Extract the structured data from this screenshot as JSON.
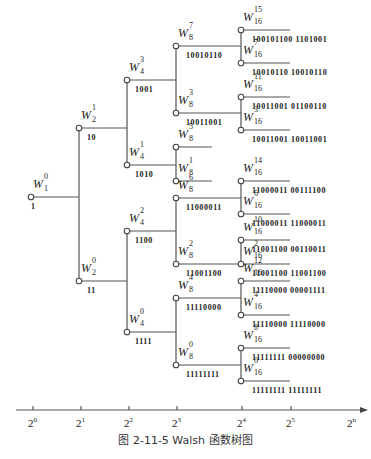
{
  "figure": {
    "caption": "图 2-11-5   Walsh 函数树图",
    "title": "Walsh 函数树图"
  },
  "nodes": [
    {
      "id": "W1_0",
      "base": "W",
      "sup": "0",
      "sub": "1",
      "code": "1",
      "x": 31,
      "y": 197
    },
    {
      "id": "W2_1",
      "base": "W",
      "sup": "1",
      "sub": "2",
      "code": "10",
      "x": 79,
      "y": 128
    },
    {
      "id": "W2_0",
      "base": "W",
      "sup": "0",
      "sub": "2",
      "code": "11",
      "x": 79,
      "y": 281
    },
    {
      "id": "W4_3",
      "base": "W",
      "sup": "3",
      "sub": "4",
      "code": "1001",
      "x": 127,
      "y": 80
    },
    {
      "id": "W4_1",
      "base": "W",
      "sup": "1",
      "sub": "4",
      "code": "1010",
      "x": 127,
      "y": 165
    },
    {
      "id": "W4_2",
      "base": "W",
      "sup": "2",
      "sub": "4",
      "code": "1100",
      "x": 127,
      "y": 231
    },
    {
      "id": "W4_0",
      "base": "W",
      "sup": "0",
      "sub": "4",
      "code": "1111",
      "x": 127,
      "y": 332
    },
    {
      "id": "W8_7",
      "base": "W",
      "sup": "7",
      "sub": "8",
      "code": "10010110",
      "x": 176,
      "y": 46
    },
    {
      "id": "W8_3",
      "base": "W",
      "sup": "3",
      "sub": "8",
      "code": "10011001",
      "x": 176,
      "y": 113
    },
    {
      "id": "W8_5",
      "base": "W",
      "sup": "5",
      "sub": "8",
      "code": "",
      "x": 176,
      "y": 147
    },
    {
      "id": "W8_1",
      "base": "W",
      "sup": "1",
      "sub": "8",
      "code": "",
      "x": 176,
      "y": 181
    },
    {
      "id": "W8_6",
      "base": "W",
      "sup": "6",
      "sub": "8",
      "code": "11000011",
      "x": 176,
      "y": 198
    },
    {
      "id": "W8_2",
      "base": "W",
      "sup": "2",
      "sub": "8",
      "code": "11001100",
      "x": 176,
      "y": 264
    },
    {
      "id": "W8_4",
      "base": "W",
      "sup": "4",
      "sub": "8",
      "code": "11110000",
      "x": 176,
      "y": 298
    },
    {
      "id": "W8_0",
      "base": "W",
      "sup": "0",
      "sub": "8",
      "code": "11111111",
      "x": 176,
      "y": 365
    },
    {
      "id": "W16_15",
      "base": "W",
      "sup": "15",
      "sub": "16",
      "code": "100101100 1101001",
      "x": 241,
      "y": 30
    },
    {
      "id": "W16_7",
      "base": "W",
      "sup": "7",
      "sub": "16",
      "code": "10010110 10010110",
      "x": 241,
      "y": 63
    },
    {
      "id": "W16_11",
      "base": "W",
      "sup": "11",
      "sub": "16",
      "code": "10011001 01100110",
      "x": 241,
      "y": 97
    },
    {
      "id": "W16_3",
      "base": "W",
      "sup": "3",
      "sub": "16",
      "code": "10011001 10011001",
      "x": 241,
      "y": 130
    },
    {
      "id": "W16_14",
      "base": "W",
      "sup": "14",
      "sub": "16",
      "code": "11000011 00111100",
      "x": 241,
      "y": 181
    },
    {
      "id": "W16_6",
      "base": "W",
      "sup": "6",
      "sub": "16",
      "code": "11000011 11000011",
      "x": 241,
      "y": 214
    },
    {
      "id": "W16_10",
      "base": "W",
      "sup": "10",
      "sub": "16",
      "code": "11001100 00110011",
      "x": 241,
      "y": 240
    },
    {
      "id": "W16_2",
      "base": "W",
      "sup": "2",
      "sub": "16",
      "code": "11001100 11001100",
      "x": 241,
      "y": 264
    },
    {
      "id": "W16_12",
      "base": "W",
      "sup": "12",
      "sub": "16",
      "code": "11110000 00001111",
      "x": 241,
      "y": 281
    },
    {
      "id": "W16_4",
      "base": "W",
      "sup": "4",
      "sub": "16",
      "code": "11110000 11110000",
      "x": 241,
      "y": 315
    },
    {
      "id": "W16_8",
      "base": "W",
      "sup": "8",
      "sub": "16",
      "code": "11111111 00000000",
      "x": 241,
      "y": 348
    },
    {
      "id": "W16_0",
      "base": "W",
      "sup": "0",
      "sub": "16",
      "code": "11111111 11111111",
      "x": 241,
      "y": 381
    }
  ],
  "axis": {
    "ticks": [
      {
        "base": "2",
        "exp": "0",
        "x": 33
      },
      {
        "base": "2",
        "exp": "1",
        "x": 81
      },
      {
        "base": "2",
        "exp": "2",
        "x": 129
      },
      {
        "base": "2",
        "exp": "3",
        "x": 177
      },
      {
        "base": "2",
        "exp": "4",
        "x": 242
      },
      {
        "base": "2",
        "exp": "5",
        "x": 291
      },
      {
        "base": "2",
        "exp": "n",
        "x": 352
      }
    ]
  }
}
